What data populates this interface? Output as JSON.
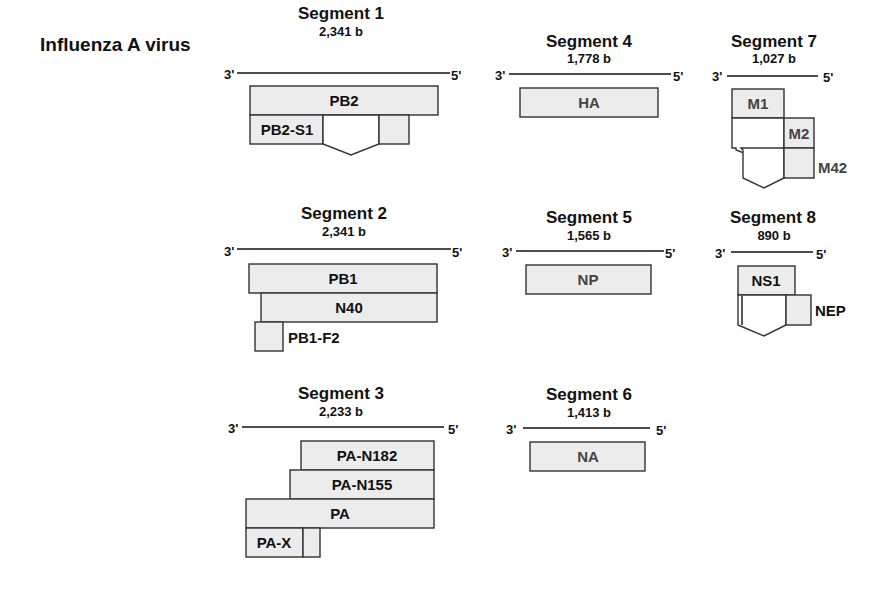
{
  "virus_label": "Influenza A virus",
  "end3": "3'",
  "end5": "5'",
  "segments": [
    {
      "title": "Segment 1",
      "length": "2,341 b",
      "proteins": [
        "PB2",
        "PB2-S1"
      ]
    },
    {
      "title": "Segment 2",
      "length": "2,341 b",
      "proteins": [
        "PB1",
        "N40",
        "PB1-F2"
      ]
    },
    {
      "title": "Segment 3",
      "length": "2,233 b",
      "proteins": [
        "PA-N182",
        "PA-N155",
        "PA",
        "PA-X"
      ]
    },
    {
      "title": "Segment 4",
      "length": "1,778 b",
      "proteins": [
        "HA"
      ]
    },
    {
      "title": "Segment 5",
      "length": "1,565 b",
      "proteins": [
        "NP"
      ]
    },
    {
      "title": "Segment 6",
      "length": "1,413 b",
      "proteins": [
        "NA"
      ]
    },
    {
      "title": "Segment 7",
      "length": "1,027 b",
      "proteins": [
        "M1",
        "M2",
        "M42"
      ]
    },
    {
      "title": "Segment 8",
      "length": "890 b",
      "proteins": [
        "NS1",
        "NEP"
      ]
    }
  ],
  "colors": {
    "box_fill": "#ececec",
    "stroke": "#333333",
    "text": "#111111"
  }
}
